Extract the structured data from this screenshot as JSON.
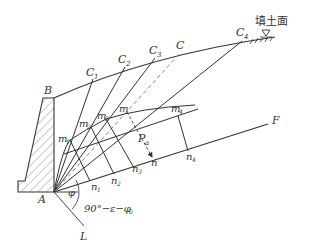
{
  "diagram": {
    "surface_label": "填土面",
    "labels": {
      "A": "A",
      "B": "B",
      "C": "C",
      "C1": "C",
      "C1_sub": "1",
      "C2": "C",
      "C2_sub": "2",
      "C3": "C",
      "C3_sub": "3",
      "C4": "C",
      "C4_sub": "4",
      "F": "F",
      "L": "L",
      "m": "m",
      "m1": "m",
      "m1_sub": "1",
      "m2": "m",
      "m2_sub": "2",
      "m3": "m",
      "m3_sub": "3",
      "m4": "m",
      "m4_sub": "4",
      "n": "n",
      "n1": "n",
      "n1_sub": "1",
      "n2": "n",
      "n2_sub": "2",
      "n3": "n",
      "n3_sub": "3",
      "n4": "n",
      "n4_sub": "4",
      "Pa": "P",
      "Pa_sub": "a",
      "phi": "φ",
      "angle_expr": "90°−ε−φ",
      "angle_expr_sub": "0"
    },
    "colors": {
      "line": "#333333",
      "dashed": "#888888",
      "hatch": "#555555"
    }
  }
}
